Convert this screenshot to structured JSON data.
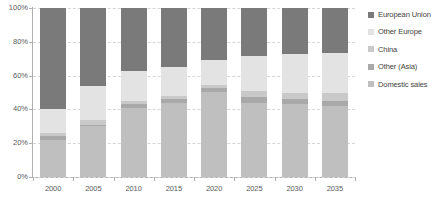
{
  "chart_data": {
    "type": "bar",
    "subtype": "stacked-100-percent",
    "title": "",
    "xlabel": "",
    "ylabel": "",
    "categories": [
      "2000",
      "2005",
      "2010",
      "2015",
      "2020",
      "2025",
      "2030",
      "2035"
    ],
    "series": [
      {
        "name": "Domestic sales",
        "color": "#bfbfbf",
        "values": [
          22,
          30,
          41,
          44,
          50.5,
          44,
          43,
          42
        ]
      },
      {
        "name": "Other (Asia)",
        "color": "#a9a9a9",
        "values": [
          2,
          1,
          2,
          2,
          2,
          3.5,
          3,
          3
        ]
      },
      {
        "name": "China",
        "color": "#c9c9c9",
        "values": [
          2,
          2.5,
          2,
          2,
          2,
          3.5,
          3.5,
          4.5
        ]
      },
      {
        "name": "Other Europe",
        "color": "#e3e3e3",
        "values": [
          14,
          20.5,
          18,
          17,
          15,
          20.5,
          23.5,
          24
        ]
      },
      {
        "name": "European Union",
        "color": "#7a7a7a",
        "values": [
          60,
          46,
          37,
          35,
          30.5,
          28.5,
          27,
          26.5
        ]
      }
    ],
    "ylim": [
      0,
      100
    ],
    "yticks": [
      "0%",
      "20%",
      "40%",
      "60%",
      "80%",
      "100%"
    ],
    "ytick_values": [
      0,
      20,
      40,
      60,
      80,
      100
    ],
    "grid": true,
    "grid_axis": "y",
    "grid_style": "dashed",
    "legend_position": "right",
    "legend": [
      {
        "label": "European Union",
        "color": "#7a7a7a"
      },
      {
        "label": "Other Europe",
        "color": "#e3e3e3"
      },
      {
        "label": "China",
        "color": "#c9c9c9"
      },
      {
        "label": "Other (Asia)",
        "color": "#a9a9a9"
      },
      {
        "label": "Domestic sales",
        "color": "#bfbfbf"
      }
    ]
  },
  "colors": {
    "axis": "#b0b0b0",
    "grid": "#d6d6d6",
    "tick_text": "#5a5a5c",
    "legend_text": "#3f3f41",
    "background": "#ffffff"
  }
}
